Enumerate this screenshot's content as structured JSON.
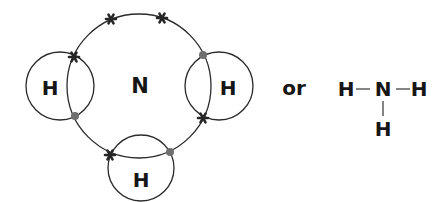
{
  "diagram": {
    "central_atom": {
      "symbol": "N",
      "cx": 139,
      "cy": 86,
      "r": 72
    },
    "hydrogen_atoms": [
      {
        "id": "h-left",
        "symbol": "H",
        "cx": 60,
        "cy": 86,
        "r": 34
      },
      {
        "id": "h-right",
        "symbol": "H",
        "cx": 219,
        "cy": 86,
        "r": 34
      },
      {
        "id": "h-bottom",
        "symbol": "H",
        "cx": 141,
        "cy": 168,
        "r": 33
      }
    ],
    "electrons": {
      "crosses": [
        {
          "note": "lone pair top-left",
          "x": 111,
          "y": 19
        },
        {
          "note": "lone pair top-right",
          "x": 162,
          "y": 18
        },
        {
          "note": "N-H left bond",
          "x": 74,
          "y": 57
        },
        {
          "note": "N-H right bond",
          "x": 203,
          "y": 118
        },
        {
          "note": "N-H bottom bond",
          "x": 110,
          "y": 155
        }
      ],
      "dots": [
        {
          "note": "H left electron",
          "x": 75,
          "y": 116
        },
        {
          "note": "H right electron",
          "x": 203,
          "y": 55
        },
        {
          "note": "H bottom electron",
          "x": 170,
          "y": 152
        }
      ]
    },
    "connector_word": "or",
    "structural_formula": {
      "center": "N",
      "left": "H",
      "right": "H",
      "bottom": "H",
      "bond": "—"
    },
    "colors": {
      "line": "#2a2a2a",
      "text": "#161616",
      "dot": "#6f6f6f",
      "cross": "#262626",
      "background": "#ffffff"
    }
  }
}
